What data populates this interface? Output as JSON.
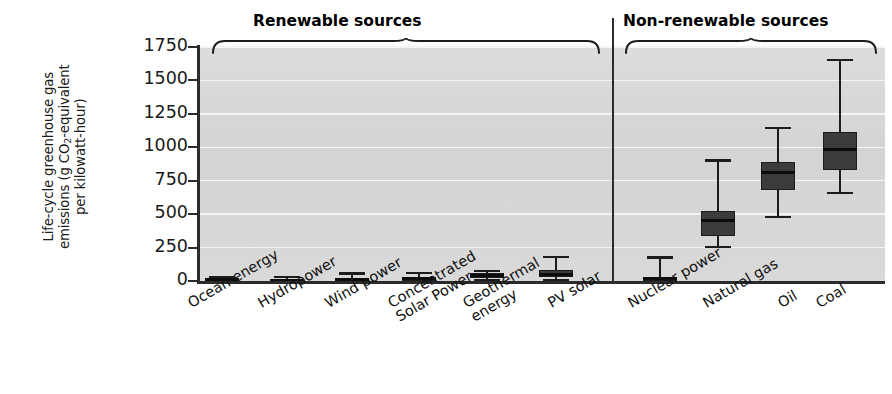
{
  "chart_data": {
    "type": "box",
    "title": "",
    "xlabel": "",
    "ylabel": "Life-cycle greenhouse gas emissions (g CO2-equivalent per kilowatt-hour)",
    "ylim": [
      0,
      1750
    ],
    "ytick_values": [
      0,
      250,
      500,
      750,
      1000,
      1250,
      1500,
      1750
    ],
    "ytick_labels": [
      "0",
      "250",
      "500",
      "750",
      "1000",
      "1250",
      "1500",
      "1750"
    ],
    "grid": "horizontal",
    "legend": "none",
    "groups": [
      {
        "id": "renewable",
        "label": "Renewable sources",
        "categories": [
          "Ocean energy",
          "Hydropower",
          "Wind power",
          "Concentrated Solar Power",
          "Geothermal energy",
          "PV solar"
        ]
      },
      {
        "id": "non-renewable",
        "label": "Non-renewable sources",
        "categories": [
          "Nuclear power",
          "Natural gas",
          "Oil",
          "Coal"
        ]
      }
    ],
    "categories": [
      "Ocean energy",
      "Hydropower",
      "Wind power",
      "Concentrated Solar Power",
      "Geothermal energy",
      "PV solar",
      "Nuclear power",
      "Natural gas",
      "Oil",
      "Coal"
    ],
    "boxes": [
      {
        "category": "Ocean energy",
        "min": 2,
        "q1": 6,
        "median": 10,
        "q3": 20,
        "max": 25
      },
      {
        "category": "Hydropower",
        "min": 1,
        "q1": 3,
        "median": 7,
        "q3": 14,
        "max": 30
      },
      {
        "category": "Wind power",
        "min": 5,
        "q1": 8,
        "median": 12,
        "q3": 20,
        "max": 55
      },
      {
        "category": "Concentrated Solar Power",
        "min": 7,
        "q1": 12,
        "median": 20,
        "q3": 28,
        "max": 60
      },
      {
        "category": "Geothermal energy",
        "min": 6,
        "q1": 22,
        "median": 40,
        "q3": 58,
        "max": 75
      },
      {
        "category": "PV solar",
        "min": 5,
        "q1": 30,
        "median": 45,
        "q3": 80,
        "max": 180
      },
      {
        "category": "Nuclear power",
        "min": 2,
        "q1": 8,
        "median": 16,
        "q3": 30,
        "max": 175
      },
      {
        "category": "Natural gas",
        "min": 255,
        "q1": 340,
        "median": 450,
        "q3": 525,
        "max": 900
      },
      {
        "category": "Oil",
        "min": 480,
        "q1": 680,
        "median": 815,
        "q3": 890,
        "max": 1145
      },
      {
        "category": "Coal",
        "min": 660,
        "q1": 830,
        "median": 980,
        "q3": 1115,
        "max": 1655
      }
    ]
  },
  "axis": {
    "y_title_line1": "Life-cycle greenhouse gas",
    "y_title_line2_a": "emissions (g CO",
    "y_title_line2_sub": "2",
    "y_title_line2_b": "-equivalent",
    "y_title_line3": "per kilowatt-hour)"
  },
  "colors": {
    "plot_background": "#d6d6d6",
    "gridline": "#f4f4f4",
    "box_fill": "#3b3b3b",
    "box_stroke": "#1c1c1c",
    "median": "#0d0d0d",
    "axis": "#2b2b2b",
    "text": "#111111"
  }
}
